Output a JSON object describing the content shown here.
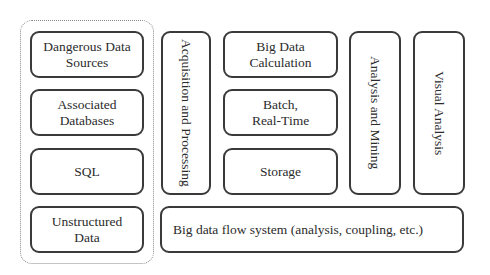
{
  "diagram": {
    "source_group": {
      "items": [
        {
          "label": "Dangerous Data\nSources"
        },
        {
          "label": "Associated\nDatabases"
        },
        {
          "label": "SQL"
        },
        {
          "label": "Unstructured\nData"
        }
      ]
    },
    "acquisition": {
      "label": "Acquisition and Processing"
    },
    "calculation_column": {
      "items": [
        {
          "label": "Big Data\nCalculation"
        },
        {
          "label": "Batch,\nReal-Time"
        },
        {
          "label": "Storage"
        }
      ]
    },
    "analysis_mining": {
      "label": "Analysis and Mining"
    },
    "visual_analysis": {
      "label": "Visual Analysis"
    },
    "flow_system": {
      "label": "Big data flow system (analysis, coupling, etc.)"
    },
    "colors": {
      "border": "#3a3a3a",
      "dotted_border": "#8a8a8a",
      "text": "#2b2b2b",
      "background": "#ffffff"
    }
  }
}
